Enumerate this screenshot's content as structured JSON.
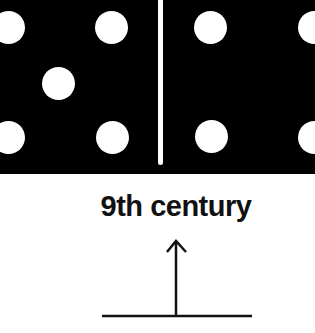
{
  "domino": {
    "background": "#000000",
    "pip_color": "#ffffff",
    "left_half": {
      "pips": [
        {
          "x": 8,
          "y": 27
        },
        {
          "x": 111,
          "y": 27
        },
        {
          "x": 58,
          "y": 83
        },
        {
          "x": 8,
          "y": 137
        },
        {
          "x": 112,
          "y": 137
        }
      ]
    },
    "right_half": {
      "pips": [
        {
          "x": 210,
          "y": 27
        },
        {
          "x": 211,
          "y": 136
        },
        {
          "x": 314,
          "y": 27
        },
        {
          "x": 314,
          "y": 137
        }
      ]
    }
  },
  "caption": {
    "text": "9th century"
  },
  "arrow": {
    "direction": "up",
    "icon": "arrow-up-icon"
  }
}
